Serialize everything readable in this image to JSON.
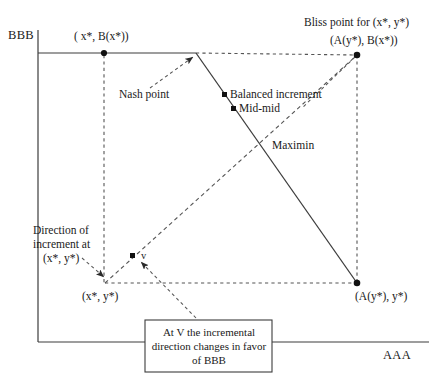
{
  "figure": {
    "title_axes": {
      "y_axis_label": "BBB",
      "x_axis_label": "AAA"
    },
    "labels": {
      "bliss_caption": "Bliss point for (x*, y*)",
      "bliss_coords": "(A(y*), B(x*))",
      "top_left_coords": "( x*, B(x*))",
      "bottom_right_coords": "(A(y*), y*)",
      "origin_coords": "(x*, y*)",
      "nash_point": "Nash point",
      "balanced_increment": "Balanced increment",
      "mid_mid": "Mid-mid",
      "maximin": "Maximin",
      "direction_line1": "Direction of",
      "direction_line2": "increment at",
      "direction_line3": "(x*, y*)",
      "v_point": "v",
      "callout": "At V the incremental direction changes in favor of BBB"
    },
    "colors": {
      "ink": "#1a1a1a",
      "line": "#3c3c3c",
      "dashed": "#555555",
      "background": "#ffffff"
    },
    "geometry": {
      "y_axis_x": 38,
      "x_axis_y": 342,
      "top_line_y": 53,
      "left_dash_x": 104,
      "right_dash_x": 357,
      "bliss_point": [
        357,
        55
      ],
      "nash_point": [
        196,
        53
      ],
      "balanced_increment_point": [
        225,
        95
      ],
      "mid_mid_point": [
        234,
        109
      ],
      "bottom_right_point": [
        357,
        283
      ],
      "origin_point": [
        105,
        283
      ],
      "v_point": [
        132,
        256
      ],
      "top_left_point": [
        104,
        53
      ],
      "callout_box": [
        145,
        320,
        127,
        52
      ]
    }
  }
}
